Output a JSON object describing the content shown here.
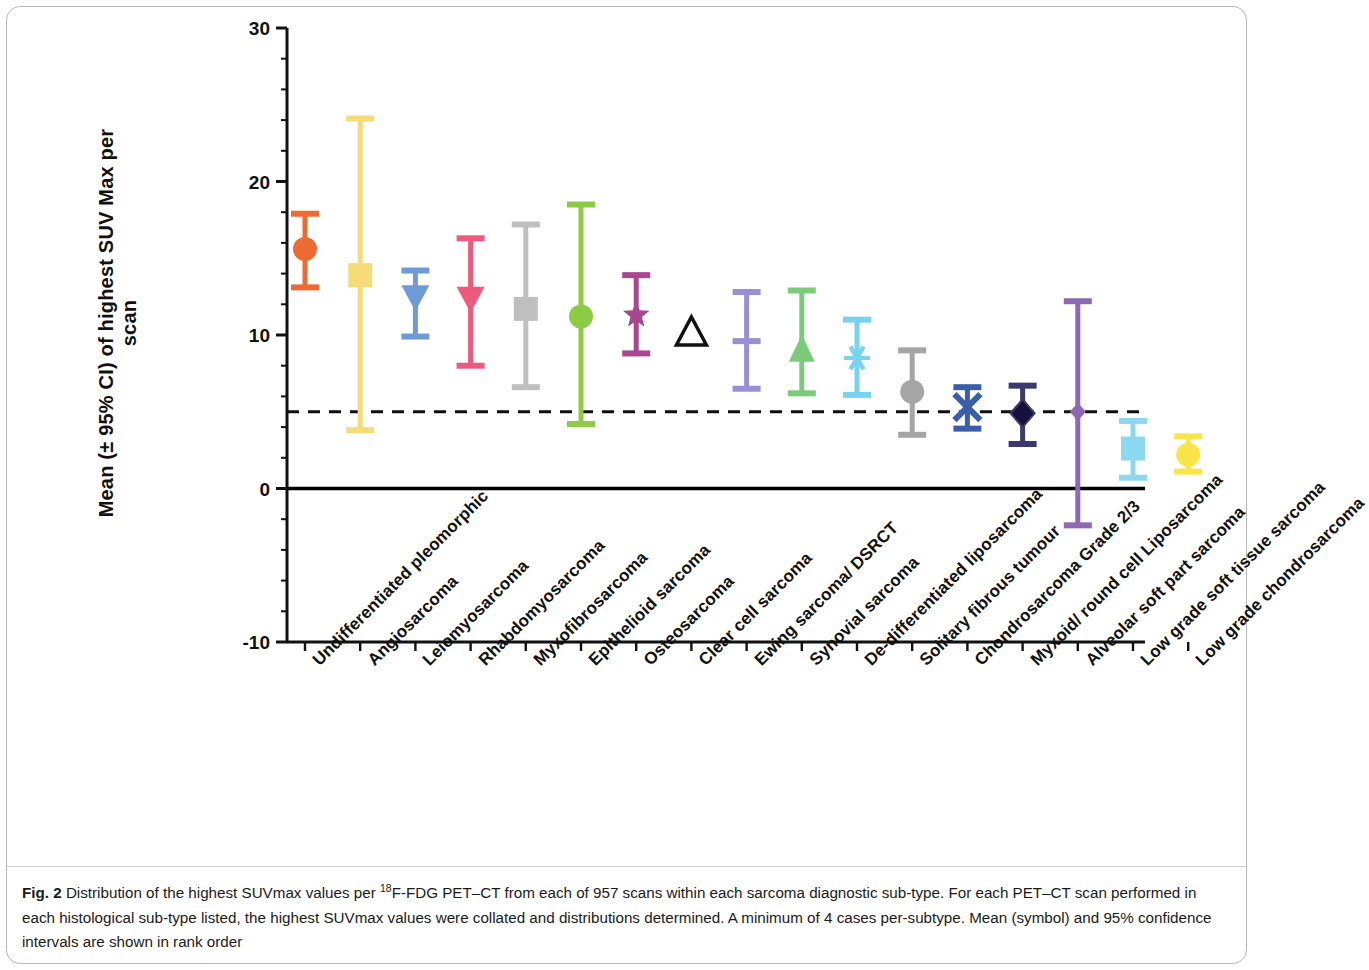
{
  "figure": {
    "label": "Fig. 2",
    "caption_part1": "Distribution of the highest SUVmax values per ",
    "caption_sup": "18",
    "caption_part2": "F-FDG PET–CT from each of 957 scans within each sarcoma diagnostic sub-type. For each PET–CT scan performed in each histological sub-type listed, the highest SUVmax values were collated and distributions determined. A minimum of 4 cases per-subtype. Mean (symbol) and 95% confidence intervals are shown in rank order"
  },
  "chart_data": {
    "type": "scatter",
    "title": "",
    "xlabel": "",
    "ylabel": "Mean (± 95% CI) of highest SUV Max per scan",
    "ylim": [
      -10,
      30
    ],
    "yticks": [
      -10,
      0,
      10,
      20,
      30
    ],
    "ytick_labels": [
      "-10",
      "0",
      "10",
      "20",
      "30"
    ],
    "grid": false,
    "legend": "none",
    "reference_lines": [
      {
        "name": "threshold",
        "value": 5,
        "style": "dashed",
        "color": "#111111"
      },
      {
        "name": "zero",
        "value": 0,
        "style": "solid",
        "color": "#000000"
      }
    ],
    "categories": [
      "Undifferentiated pleomorphic",
      "Angiosarcoma",
      "Leiomyosarcoma",
      "Rhabdomyosarcoma",
      "Myxofibrosarcoma",
      "Epithelioid sarcoma",
      "Osteosarcoma",
      "Clear cell sarcoma",
      "Ewing sarcoma/ DSRCT",
      "Synovial sarcoma",
      "De-differentiated liposarcoma",
      "Solitary fibrous tumour",
      "Chondrosarcoma Grade 2/3",
      "Myxoid/ round cell Liposarcoma",
      "Alveolar soft part sarcoma",
      "Low grade soft tissue sarcoma",
      "Low grade chondrosarcoma"
    ],
    "points": [
      {
        "category": "Undifferentiated pleomorphic",
        "mean": 15.6,
        "ci_low": 13.1,
        "ci_high": 17.9,
        "color": "#ED6B33",
        "marker": "circle"
      },
      {
        "category": "Angiosarcoma",
        "mean": 13.9,
        "ci_low": 3.8,
        "ci_high": 24.1,
        "color": "#F5DC78",
        "marker": "square"
      },
      {
        "category": "Leiomyosarcoma",
        "mean": 12.4,
        "ci_low": 9.9,
        "ci_high": 14.2,
        "color": "#6E9BD8",
        "marker": "triangle-down"
      },
      {
        "category": "Rhabdomyosarcoma",
        "mean": 12.3,
        "ci_low": 8.0,
        "ci_high": 16.3,
        "color": "#ED5A7E",
        "marker": "triangle-down"
      },
      {
        "category": "Myxofibrosarcoma",
        "mean": 11.7,
        "ci_low": 6.6,
        "ci_high": 17.2,
        "color": "#BFBFBF",
        "marker": "square"
      },
      {
        "category": "Epithelioid sarcoma",
        "mean": 11.2,
        "ci_low": 4.2,
        "ci_high": 18.5,
        "color": "#8DCB45",
        "marker": "circle"
      },
      {
        "category": "Osteosarcoma",
        "mean": 11.3,
        "ci_low": 8.8,
        "ci_high": 13.9,
        "color": "#A8478F",
        "marker": "star"
      },
      {
        "category": "Clear cell sarcoma",
        "mean": 10.2,
        "ci_low": null,
        "ci_high": null,
        "color": "#111111",
        "marker": "triangle-up-open"
      },
      {
        "category": "Ewing sarcoma/ DSRCT",
        "mean": 9.6,
        "ci_low": 6.5,
        "ci_high": 12.8,
        "color": "#9A8FD6",
        "marker": "ibar"
      },
      {
        "category": "Synovial sarcoma",
        "mean": 9.1,
        "ci_low": 6.2,
        "ci_high": 12.9,
        "color": "#7CCB7A",
        "marker": "triangle-up"
      },
      {
        "category": "De-differentiated liposarcoma",
        "mean": 8.5,
        "ci_low": 6.1,
        "ci_high": 11.0,
        "color": "#77D4EE",
        "marker": "asterisk"
      },
      {
        "category": "Solitary fibrous tumour",
        "mean": 6.3,
        "ci_low": 3.5,
        "ci_high": 9.0,
        "color": "#A5A5A5",
        "marker": "circle"
      },
      {
        "category": "Chondrosarcoma Grade 2/3",
        "mean": 5.3,
        "ci_low": 3.9,
        "ci_high": 6.6,
        "color": "#3A5FA8",
        "marker": "x-cross"
      },
      {
        "category": "Myxoid/ round cell Liposarcoma",
        "mean": 4.9,
        "ci_low": 2.9,
        "ci_high": 6.7,
        "color": "#3B3970",
        "marker": "diamond"
      },
      {
        "category": "Alveolar soft part sarcoma",
        "mean": 5.0,
        "ci_low": -2.4,
        "ci_high": 12.2,
        "color": "#8E68B4",
        "marker": "diamond-small"
      },
      {
        "category": "Low grade soft tissue sarcoma",
        "mean": 2.6,
        "ci_low": 0.7,
        "ci_high": 4.4,
        "color": "#8BD8F0",
        "marker": "square"
      },
      {
        "category": "Low grade chondrosarcoma",
        "mean": 2.2,
        "ci_low": 1.1,
        "ci_high": 3.4,
        "color": "#F9E547",
        "marker": "circle"
      }
    ]
  }
}
